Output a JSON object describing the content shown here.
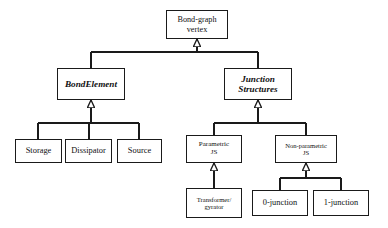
{
  "diagram": {
    "type": "uml-generalization-tree",
    "colors": {
      "background": "#ffffff",
      "stroke": "#1a1a1a",
      "text": "#111111",
      "node_fill": "#ffffff"
    },
    "nodes": {
      "root": {
        "label": "Bond-graph\nvertex",
        "x": 166,
        "y": 10,
        "w": 62,
        "h": 29
      },
      "bond_element": {
        "label": "BondElement",
        "x": 57,
        "y": 68,
        "w": 68,
        "h": 32
      },
      "junction_structures": {
        "label": "Junction\nStructures",
        "x": 224,
        "y": 68,
        "w": 68,
        "h": 32
      },
      "storage": {
        "label": "Storage",
        "x": 15,
        "y": 139,
        "w": 47,
        "h": 24
      },
      "dissipator": {
        "label": "Dissipator",
        "x": 65,
        "y": 139,
        "w": 47,
        "h": 24
      },
      "source": {
        "label": "Source",
        "x": 117,
        "y": 139,
        "w": 45,
        "h": 24
      },
      "parametric_js": {
        "label": "Parametric\nJS",
        "x": 186,
        "y": 135,
        "w": 56,
        "h": 28
      },
      "non_parametric_js": {
        "label": "Non-parametric\nJS",
        "x": 275,
        "y": 135,
        "w": 62,
        "h": 28
      },
      "transformer_gyrator": {
        "label": "Transformer/\ngyrator",
        "x": 186,
        "y": 188,
        "w": 56,
        "h": 30
      },
      "zero_junction": {
        "label": "0-junction",
        "x": 252,
        "y": 190,
        "w": 56,
        "h": 26
      },
      "one_junction": {
        "label": "1-junction",
        "x": 313,
        "y": 190,
        "w": 56,
        "h": 26
      }
    },
    "edges": [
      {
        "from": "bond_element",
        "to": "root",
        "kind": "generalization"
      },
      {
        "from": "junction_structures",
        "to": "root",
        "kind": "generalization"
      },
      {
        "from": "storage",
        "to": "bond_element",
        "kind": "generalization"
      },
      {
        "from": "dissipator",
        "to": "bond_element",
        "kind": "generalization"
      },
      {
        "from": "source",
        "to": "bond_element",
        "kind": "generalization"
      },
      {
        "from": "parametric_js",
        "to": "junction_structures",
        "kind": "generalization"
      },
      {
        "from": "non_parametric_js",
        "to": "junction_structures",
        "kind": "generalization"
      },
      {
        "from": "transformer_gyrator",
        "to": "parametric_js",
        "kind": "generalization"
      },
      {
        "from": "zero_junction",
        "to": "non_parametric_js",
        "kind": "generalization"
      },
      {
        "from": "one_junction",
        "to": "non_parametric_js",
        "kind": "generalization"
      }
    ]
  }
}
